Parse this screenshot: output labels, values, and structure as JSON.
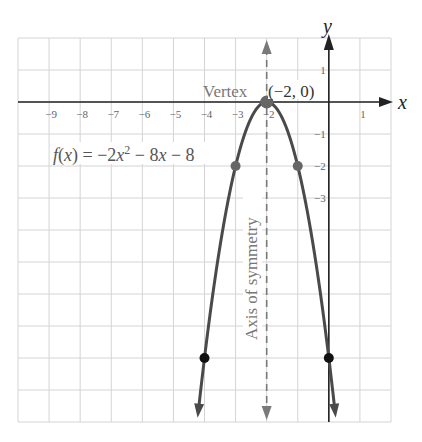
{
  "chart_data": {
    "type": "line",
    "title": "",
    "function_label": "f(x) = −2x² − 8x − 8",
    "function_label_parts": {
      "lhs": "f(x) = −2x",
      "exp": "2",
      "rhs": " − 8x − 8"
    },
    "xlabel": "x",
    "ylabel": "y",
    "xlim": [
      -10,
      2
    ],
    "ylim": [
      -10,
      2
    ],
    "grid": true,
    "x_ticks": [
      -9,
      -8,
      -7,
      -6,
      -5,
      -4,
      -3,
      -2,
      1
    ],
    "x_tick_labels": [
      "−9",
      "−8",
      "−7",
      "−6",
      "−5",
      "−4",
      "−3",
      "−2",
      "1"
    ],
    "y_ticks": [
      1,
      -1,
      -2,
      -3
    ],
    "y_tick_labels": [
      "1",
      "−1",
      "−2",
      "−3"
    ],
    "series": [
      {
        "name": "f(x) = -2x^2 - 8x - 8",
        "coefficients": {
          "a": -2,
          "b": -8,
          "c": -8
        },
        "x_range": [
          -4.2,
          0.2
        ]
      }
    ],
    "points": [
      {
        "x": -2,
        "y": 0,
        "label": "Vertex",
        "style": "vertex"
      },
      {
        "x": -3,
        "y": -2,
        "style": "gray"
      },
      {
        "x": -1,
        "y": -2,
        "style": "gray"
      },
      {
        "x": -4,
        "y": -8,
        "style": "black"
      },
      {
        "x": 0,
        "y": -8,
        "style": "black"
      }
    ],
    "annotations": [
      {
        "text": "Vertex",
        "x": -2,
        "y": 0
      },
      {
        "text": "(−2, 0)",
        "x": -2,
        "y": 0
      },
      {
        "text": "Axis of symmetry",
        "x": -2,
        "orientation": "vertical"
      }
    ],
    "axis_of_symmetry": {
      "x": -2,
      "style": "dashed"
    }
  },
  "labels": {
    "vertex_word": "Vertex",
    "vertex_coords": "(−2, 0)",
    "axis_of_symmetry": "Axis of symmetry",
    "x_axis": "x",
    "y_axis": "y"
  },
  "colors": {
    "grid": "#d4d4d4",
    "axis": "#222222",
    "curve": "#4a4a4a",
    "dashed_axis": "#7a7a7a",
    "label_gray": "#777777",
    "dot_gray": "#666666",
    "dot_black": "#111111"
  }
}
